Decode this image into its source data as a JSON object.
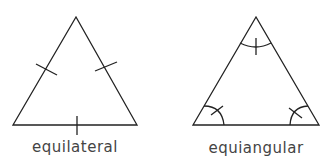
{
  "figures": [
    {
      "name": "equilateral",
      "label": "equilateral",
      "marking": "tick marks on each side (equal sides)"
    },
    {
      "name": "equiangular",
      "label": "equiangular",
      "marking": "arc with tick at each angle (equal angles)"
    }
  ],
  "colors": {
    "stroke": "#222222",
    "text": "#444444"
  }
}
